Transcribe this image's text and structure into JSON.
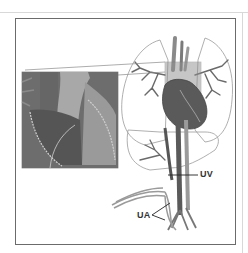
{
  "figure": {
    "labels": {
      "uv": "UV",
      "ua": "UA"
    },
    "colors": {
      "frame": "#6b6b6b",
      "vessel_dark": "#555555",
      "vessel_mid": "#8a8a8a",
      "vessel_light": "#b5b5b5",
      "outline": "#9a9a9a",
      "label_text": "#333333"
    }
  }
}
